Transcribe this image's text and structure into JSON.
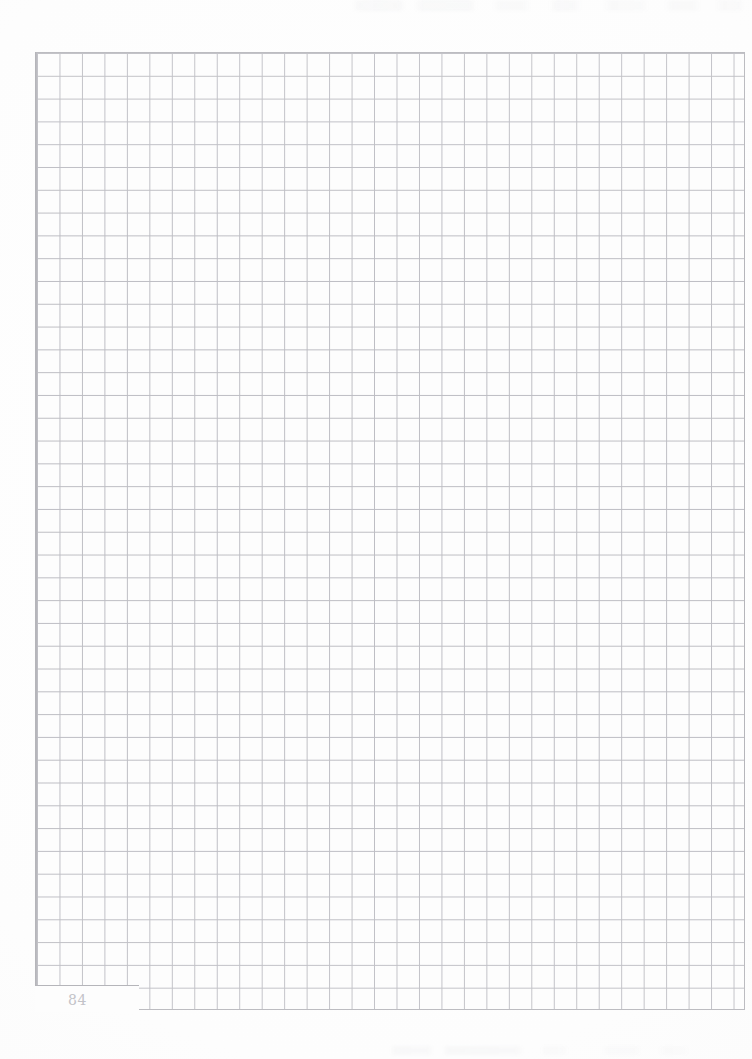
{
  "page": {
    "kind": "graph-paper-notebook-page",
    "page_number": "84",
    "background_color": "#fdfdfd",
    "grid_line_color": "#bcbcc2",
    "grid_border_color": "#b5b5ba",
    "page_number_color": "#c3c3c8"
  },
  "grid": {
    "columns": 32,
    "rows": 42,
    "cell_width_px": 22.47,
    "cell_height_px": 22.81,
    "left_px": 36,
    "top_px": 52,
    "width_px": 709,
    "height_px": 958
  },
  "artifacts": {
    "top_bleed_label": "faint bleed-through marks",
    "bottom_bleed_label": "faint bleed-through marks"
  }
}
